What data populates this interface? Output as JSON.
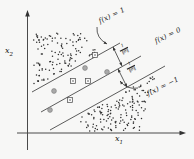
{
  "figure": {
    "axis_labels": {
      "x_base": "x",
      "x_sub": "1",
      "y_base": "x",
      "y_sub": "2"
    },
    "line_labels": {
      "plus": "f(x) = 1",
      "zero": "f(x) = 0",
      "minus": "f(x) = −1"
    },
    "margin_label": {
      "numerator": "1",
      "denominator": "‖θ‖"
    },
    "colors": {
      "ink": "#2e2e2e",
      "line": "#4a4a4a",
      "arrow": "#333333",
      "sv_circle_fill": "#a9a9a9",
      "sv_circle_stroke": "#777777",
      "sv_square_fill": "#fbfbfb",
      "sv_square_stroke": "#4a4a4a",
      "background": "#f7f7f6"
    },
    "geometry": {
      "axes": {
        "origin_x": 27.5,
        "axis_y": 133,
        "v_top": 13,
        "v_bottom": 150,
        "h_left": 17,
        "h_right": 183
      },
      "lines": {
        "plus": {
          "x1": 32,
          "y1": 92,
          "x2": 120,
          "y2": 43
        },
        "zero": {
          "x1": 41,
          "y1": 112,
          "x2": 141,
          "y2": 56
        },
        "minus": {
          "x1": 50,
          "y1": 130,
          "x2": 165,
          "y2": 66
        }
      },
      "margin_arrows": [
        {
          "x1": 113,
          "y1": 47,
          "x2": 122,
          "y2": 66
        },
        {
          "x1": 118,
          "y1": 69,
          "x2": 127,
          "y2": 87
        }
      ],
      "curved_arrows": [
        {
          "x1": 97,
          "y1": 27,
          "cx": 96,
          "cy": 38,
          "x2": 107,
          "y2": 44
        },
        {
          "x1": 138,
          "y1": 88,
          "cx": 127,
          "cy": 90,
          "x2": 120,
          "y2": 81
        }
      ],
      "support_vectors": {
        "circles": [
          [
            85,
            68
          ],
          [
            107,
            72
          ],
          [
            54,
            91
          ],
          [
            50,
            110
          ]
        ],
        "squares": [
          [
            95,
            55
          ],
          [
            73,
            81
          ],
          [
            88,
            81
          ],
          [
            70,
            100
          ]
        ]
      }
    },
    "scatter": {
      "seed": 11,
      "upper_count": 120,
      "lower_count": 150,
      "dot_radius": 0.75
    }
  }
}
